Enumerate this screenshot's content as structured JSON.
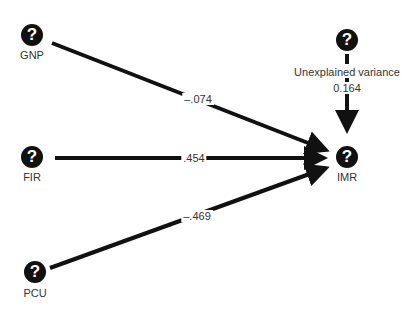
{
  "diagram": {
    "type": "path-diagram",
    "nodes": [
      {
        "id": "GNP",
        "label": "GNP",
        "icon": "question-circle-icon"
      },
      {
        "id": "FIR",
        "label": "FIR",
        "icon": "question-circle-icon"
      },
      {
        "id": "PCU",
        "label": "PCU",
        "icon": "question-circle-icon"
      },
      {
        "id": "IMR",
        "label": "IMR",
        "icon": "question-circle-icon"
      },
      {
        "id": "UV",
        "label": "Unexplained variance",
        "value": "0.164",
        "icon": "question-circle-icon"
      }
    ],
    "edges": [
      {
        "from": "GNP",
        "to": "IMR",
        "coefficient": "–.074"
      },
      {
        "from": "FIR",
        "to": "IMR",
        "coefficient": ".454"
      },
      {
        "from": "PCU",
        "to": "IMR",
        "coefficient": "–.469"
      },
      {
        "from": "UV",
        "to": "IMR",
        "coefficient": "0.164"
      }
    ],
    "icon_glyph": "?"
  }
}
